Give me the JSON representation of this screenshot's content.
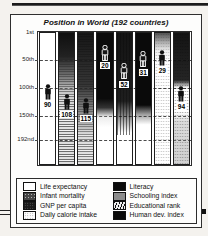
{
  "title": "Position in World (192 countries)",
  "axis": {
    "ticks": [
      "1st",
      "50th",
      "100th",
      "150th",
      "192nd"
    ],
    "tick_ranks": [
      1,
      50,
      100,
      150,
      192
    ]
  },
  "chart_data": {
    "type": "scatter",
    "title": "Position in World (192 countries)",
    "categories": [
      "Life expectancy",
      "Infant mortality",
      "GNP per capita",
      "Daily calorie intake",
      "Literacy",
      "Schooling index",
      "Educational rank",
      "Human dev. index"
    ],
    "values": [
      90,
      108,
      115,
      20,
      52,
      31,
      29,
      94
    ],
    "xlabel": "",
    "ylabel": "",
    "ylim": [
      1,
      192
    ],
    "y_axis_inverted": true,
    "yticks": [
      "1st",
      "50th",
      "100th",
      "150th",
      "192nd"
    ],
    "boxed_value_indices": [
      4,
      5
    ],
    "marker": "person-silhouette",
    "grid": "dashed-horizontal",
    "legend_position": "bottom"
  },
  "legend": {
    "left": [
      {
        "label": "Life expectancy",
        "swatch": "white"
      },
      {
        "label": "Infant mortality",
        "swatch": "halftone-dark"
      },
      {
        "label": "GNP per capita",
        "swatch": "black-speckle"
      },
      {
        "label": "Daily calorie intake",
        "swatch": "light-dotted"
      }
    ],
    "right": [
      {
        "label": "Literacy",
        "swatch": "solid-black"
      },
      {
        "label": "Schooling index",
        "swatch": "halftone-mid"
      },
      {
        "label": "Educational rank",
        "swatch": "diagonal-hatch"
      },
      {
        "label": "Human dev. index",
        "swatch": "solid-black"
      }
    ]
  },
  "colors": {
    "ink": "#111111",
    "paper": "#fdfdfc"
  }
}
